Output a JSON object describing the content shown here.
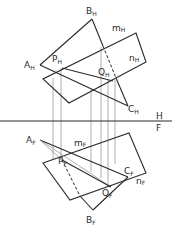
{
  "diagram": {
    "type": "descriptive-geometry-intersection",
    "fold_line": {
      "upper": "H",
      "lower": "F",
      "y": 121
    },
    "top_view": {
      "points": {
        "A": {
          "label": "A",
          "sub": "H",
          "x": 40,
          "y": 65
        },
        "B": {
          "label": "B",
          "sub": "H",
          "x": 92,
          "y": 19
        },
        "C": {
          "label": "C",
          "sub": "H",
          "x": 128,
          "y": 106
        },
        "P": {
          "label": "P",
          "sub": "H",
          "x": 62,
          "y": 68
        },
        "Q": {
          "label": "Q",
          "sub": "H",
          "x": 113,
          "y": 81
        }
      },
      "plane_labels": {
        "m": {
          "label": "m",
          "sub": "H"
        },
        "n": {
          "label": "n",
          "sub": "H"
        }
      }
    },
    "front_view": {
      "points": {
        "A": {
          "label": "A",
          "sub": "F",
          "x": 40,
          "y": 140
        },
        "B": {
          "label": "B",
          "sub": "F",
          "x": 93,
          "y": 210
        },
        "C": {
          "label": "C",
          "sub": "F",
          "x": 128,
          "y": 177
        },
        "P": {
          "label": "P",
          "sub": "F",
          "x": 62,
          "y": 160
        },
        "Q": {
          "label": "Q",
          "sub": "F",
          "x": 111,
          "y": 187
        }
      },
      "plane_labels": {
        "m": {
          "label": "m",
          "sub": "F"
        },
        "n": {
          "label": "n",
          "sub": "F"
        }
      }
    },
    "projector_x": [
      53,
      61,
      91,
      101,
      108,
      115
    ]
  }
}
